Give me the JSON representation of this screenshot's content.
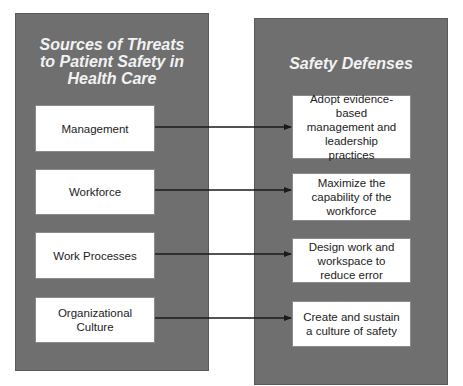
{
  "diagram": {
    "left_panel": {
      "title": "Sources of Threats to Patient Safety in Health Care",
      "items": [
        {
          "label": "Management"
        },
        {
          "label": "Workforce"
        },
        {
          "label": "Work Processes"
        },
        {
          "label": "Organizational Culture"
        }
      ]
    },
    "right_panel": {
      "title": "Safety Defenses",
      "items": [
        {
          "label": "Adopt evidence-based management and leadership practices"
        },
        {
          "label": "Maximize the capability of the workforce"
        },
        {
          "label": "Design work and workspace to reduce error"
        },
        {
          "label": "Create and sustain a culture of safety"
        }
      ]
    },
    "connections": [
      {
        "from": "Management",
        "to": "Adopt evidence-based management and leadership practices"
      },
      {
        "from": "Workforce",
        "to": "Maximize the capability of the workforce"
      },
      {
        "from": "Work Processes",
        "to": "Design work and workspace to reduce error"
      },
      {
        "from": "Organizational Culture",
        "to": "Create and sustain a culture of safety"
      }
    ],
    "colors": {
      "panel_fill": "#6f6f6f",
      "panel_title": "#f2f2f2",
      "box_fill": "#ffffff",
      "arrow": "#1a1a1a"
    }
  }
}
